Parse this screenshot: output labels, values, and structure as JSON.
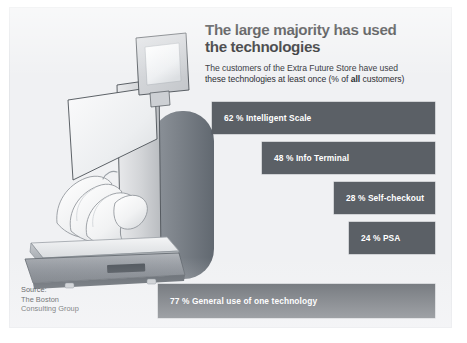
{
  "card": {
    "background_color": "#f0f1f3",
    "bar_color": "#5b6066",
    "bar_label_color": "#ffffff",
    "title_color": "#17181a"
  },
  "header": {
    "title_line1": "The large majority has used",
    "title_line2": "the technologies",
    "subtitle_line1": "The customers of the Extra Future Store have used",
    "subtitle_line2_pre": "these technologies at least once (% of ",
    "subtitle_line2_bold": "all",
    "subtitle_line2_post": " customers)"
  },
  "source": {
    "line1": "Source:",
    "line2": "The Boston",
    "line3": "Consulting Group"
  },
  "illustration": {
    "name": "intelligent-scale-illustration",
    "parts": [
      "monitor-screen",
      "angled-display-panel",
      "kiosk-column",
      "rounded-pillar",
      "weighing-platform",
      "banana-bunch"
    ]
  },
  "chart_data": {
    "type": "bar",
    "orientation": "horizontal",
    "title": "The large majority has used the technologies",
    "subtitle": "The customers of the Extra Future Store have used these technologies at least once (% of all customers)",
    "xlabel": "",
    "ylabel": "",
    "unit": "%",
    "xlim": [
      0,
      100
    ],
    "grid": false,
    "legend": false,
    "alignment": "right-aligned bars, bar length proportional to value",
    "categories": [
      "Intelligent Scale",
      "Info Terminal",
      "Self-checkout",
      "PSA",
      "General use of one technology"
    ],
    "values": [
      62,
      48,
      28,
      24,
      77
    ],
    "bars": [
      {
        "value": 62,
        "label": "62 % Intelligent Scale",
        "category": "Intelligent Scale"
      },
      {
        "value": 48,
        "label": "48 % Info Terminal",
        "category": "Info Terminal"
      },
      {
        "value": 28,
        "label": "28 % Self-checkout",
        "category": "Self-checkout"
      },
      {
        "value": 24,
        "label": "24 % PSA",
        "category": "PSA"
      },
      {
        "value": 77,
        "label": "77 % General use of one technology",
        "category": "General use of one technology"
      }
    ]
  }
}
